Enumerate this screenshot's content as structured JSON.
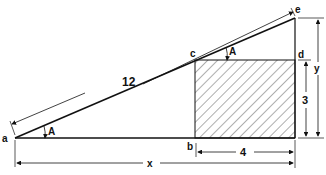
{
  "diagram": {
    "type": "geometry-figure",
    "colors": {
      "stroke": "#111111",
      "background": "#ffffff",
      "hatch": "#333333"
    },
    "points": {
      "a": {
        "label": "a",
        "x": 15,
        "y": 138
      },
      "b": {
        "label": "b",
        "x": 195,
        "y": 138
      },
      "c": {
        "label": "c",
        "x": 195,
        "y": 60
      },
      "d": {
        "label": "d",
        "x": 295,
        "y": 60
      },
      "e": {
        "label": "e",
        "x": 295,
        "y": 18
      }
    },
    "angles": [
      {
        "label": "A",
        "vertex": "a"
      },
      {
        "label": "A",
        "vertex": "c"
      }
    ],
    "dimensions": {
      "hypotenuse": "12",
      "base_total": "x",
      "rect_width": "4",
      "rect_height": "3",
      "height_total": "y"
    },
    "shaded_region": "rectangle bcde-d (b, c, d, base)"
  }
}
